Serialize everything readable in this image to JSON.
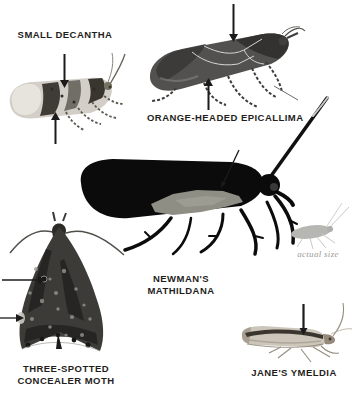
{
  "figure": {
    "background": "#ffffff",
    "palette": {
      "label_color": "#1f1e1c",
      "arrow_color": "#1b1b1b",
      "caption_color": "#9b9b98",
      "black_moth": "#0b0b0b",
      "wing_patch_gray": "#8e8e85",
      "silhouette_gray": "#b6b6b2"
    },
    "specimens": {
      "small_decantha": {
        "label": "SMALL DECANTHA"
      },
      "orange_headed_epicallima": {
        "label": "ORANGE-HEADED EPICALLIMA"
      },
      "newmans_mathildana": {
        "label_line1": "NEWMAN'S",
        "label_line2": "MATHILDANA"
      },
      "three_spotted_concealer_moth": {
        "label_line1": "THREE-SPOTTED",
        "label_line2": "CONCEALER MOTH"
      },
      "janes_ymeldia": {
        "label": "JANE'S YMELDIA"
      },
      "scale_note": {
        "caption": "actual size"
      }
    }
  }
}
